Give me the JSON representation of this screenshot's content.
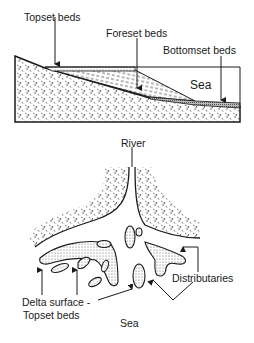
{
  "cross_section": {
    "labels": {
      "topset": "Topset beds",
      "foreset": "Foreset beds",
      "bottomset": "Bottomset beds",
      "sea": "Sea"
    }
  },
  "plan_view": {
    "labels": {
      "river": "River",
      "distributaries": "Distributaries",
      "delta_surface_line1": "Delta surface -",
      "delta_surface_line2": "Topset beds",
      "sea": "Sea"
    }
  },
  "colors": {
    "ink": "#1a1a1a",
    "background": "#ffffff"
  }
}
